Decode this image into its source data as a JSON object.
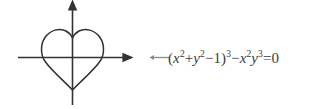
{
  "figure": {
    "background_color": "#ffffff",
    "stroke_color": "#333333",
    "text_color": "#3b3b3b"
  },
  "plot": {
    "curve_name": "heart-curve",
    "axes": {
      "x_axis": {
        "label": "x-axis",
        "start": [
          18,
          57
        ],
        "end": [
          128,
          57
        ],
        "arrow": "right"
      },
      "y_axis": {
        "label": "y-axis",
        "start": [
          72,
          105
        ],
        "end": [
          72,
          5
        ],
        "arrow": "up"
      }
    },
    "curve": {
      "left_extent": 41,
      "right_extent": 104,
      "top_extent": 27,
      "bottom_tip": 90,
      "cusp": 32,
      "center_x": 72
    }
  },
  "pointer": {
    "icon": "left-arrow-icon",
    "direction": "left"
  },
  "equation": {
    "full_text": "(x²+y²−1)³−x²y³=0",
    "open_paren": "(",
    "term1_var": "x",
    "term1_sup": "2",
    "plus": "+",
    "term2_var": "y",
    "term2_sup": "2",
    "minus1": "−",
    "one": "1",
    "close_paren": ")",
    "close_sup": "3",
    "minus2": "−",
    "term3_var": "x",
    "term3_sup": "2",
    "term4_var": "y",
    "term4_sup": "3",
    "equals": "=",
    "zero": "0"
  }
}
